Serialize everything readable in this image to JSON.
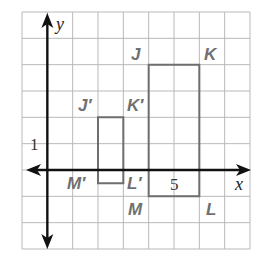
{
  "chart_data": {
    "type": "scatter",
    "title": "",
    "grid": true,
    "xlim": [
      -1,
      8
    ],
    "ylim": [
      -3,
      6
    ],
    "xlabel": "x",
    "ylabel": "y",
    "tick_labels": [
      {
        "axis": "y",
        "value": 1,
        "text": "1"
      },
      {
        "axis": "x",
        "value": 5,
        "text": "5"
      }
    ],
    "shapes": [
      {
        "name": "JKLM",
        "type": "rectangle",
        "vertices": [
          {
            "label": "J",
            "x": 4,
            "y": 4
          },
          {
            "label": "K",
            "x": 6,
            "y": 4
          },
          {
            "label": "L",
            "x": 6,
            "y": -1
          },
          {
            "label": "M",
            "x": 4,
            "y": -1
          }
        ],
        "stroke": "#6e6e6e"
      },
      {
        "name": "J'K'L'M'",
        "type": "rectangle",
        "vertices": [
          {
            "label": "J'",
            "x": 2,
            "y": 2
          },
          {
            "label": "K'",
            "x": 3,
            "y": 2
          },
          {
            "label": "L'",
            "x": 3,
            "y": -0.5
          },
          {
            "label": "M'",
            "x": 2,
            "y": -0.5
          }
        ],
        "stroke": "#6e6e6e"
      }
    ]
  },
  "labels": {
    "x_axis": "x",
    "y_axis": "y",
    "y_tick_1": "1",
    "x_tick_5": "5",
    "J": "J",
    "K": "K",
    "L": "L",
    "M": "M",
    "Jp": "J′",
    "Kp": "K′",
    "Lp": "L′",
    "Mp": "M′"
  }
}
